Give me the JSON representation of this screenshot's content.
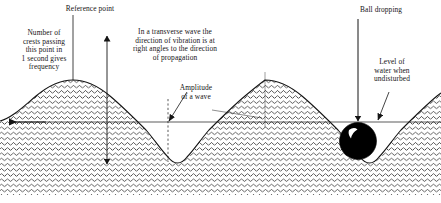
{
  "diagram": {
    "colors": {
      "ink": "#151515",
      "water_fill": "#ffffff",
      "hatch": "#151515",
      "ball": "#000000",
      "ball_highlight": "#ffffff",
      "background": "#ffffff"
    },
    "labels": {
      "reference_point": "Reference point",
      "frequency": "Number of\ncrests passing\nthis point in\n1 second gives\nfrequency",
      "transverse": "In a transverse wave the\ndirection of vibration is at\nright angles to the direction\nof propagation",
      "amplitude": "Amplitude\nof a wave",
      "ball_dropping": "Ball dropping",
      "water_level": "Level of\nwater when\nundisturbed"
    },
    "annotations": {
      "propagation_arrow": "propagation-direction-arrow",
      "vibration_arrow": "vibration-direction-double-arrow",
      "reference_line": "reference-point-leader-line",
      "amplitude_pointer": "amplitude-leader-arrow",
      "ball_drop_arrow": "ball-drop-arrow",
      "water_level_pointer": "water-level-leader-arrow"
    },
    "geometry": {
      "undisturbed_level_y": 122,
      "crest_y": 80,
      "trough_y": 163,
      "crest_x": [
        73,
        265
      ],
      "trough_x": [
        168,
        358
      ],
      "wavelength": 192,
      "amplitude": 42,
      "ball_center_x": 358,
      "ball_center_y": 141,
      "ball_radius": 18,
      "seabed_y": 172,
      "frame_width": 441,
      "frame_height": 203
    }
  }
}
